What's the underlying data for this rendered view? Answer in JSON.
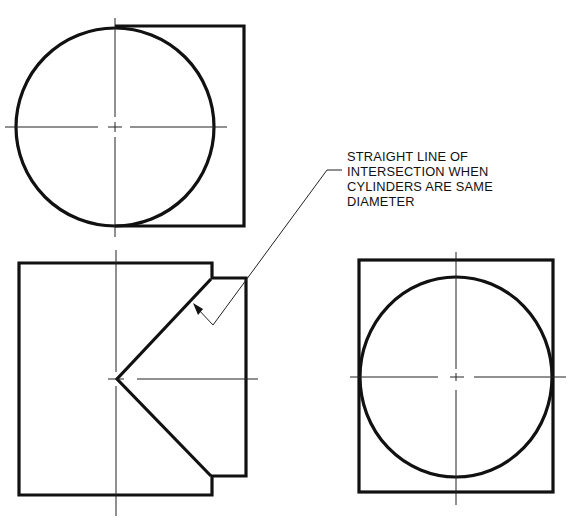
{
  "figure": {
    "views": [
      {
        "name": "top-view"
      },
      {
        "name": "front-view"
      },
      {
        "name": "side-view"
      }
    ],
    "annotation": {
      "lines": [
        "STRAIGHT LINE OF",
        "INTERSECTION WHEN",
        "CYLINDERS ARE SAME",
        "DIAMETER"
      ]
    },
    "colors": {
      "line": "#111111",
      "background": "#ffffff"
    }
  }
}
